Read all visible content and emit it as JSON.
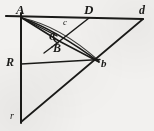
{
  "figure": {
    "type": "geometry-diagram",
    "width": 154,
    "height": 131,
    "background_color": "#f2f1ef",
    "ink_color": "#1a1a18"
  },
  "points": [
    {
      "id": "A",
      "label": "A",
      "x": 21,
      "y": 17,
      "label_x": 16,
      "label_y": 3
    },
    {
      "id": "D",
      "label": "D",
      "x": 89,
      "y": 18,
      "label_x": 84,
      "label_y": 3
    },
    {
      "id": "d",
      "label": "d",
      "x": 143,
      "y": 19,
      "label_x": 139,
      "label_y": 4
    },
    {
      "id": "c",
      "label": "c",
      "x": 67,
      "y": 26,
      "label_x": 63,
      "label_y": 18
    },
    {
      "id": "C",
      "label": "C",
      "x": 56,
      "y": 38,
      "label_x": 49,
      "label_y": 31
    },
    {
      "id": "B",
      "label": "B",
      "x": 59,
      "y": 40,
      "label_x": 53,
      "label_y": 42
    },
    {
      "id": "b",
      "label": "b",
      "x": 99,
      "y": 62,
      "label_x": 101,
      "label_y": 58
    },
    {
      "id": "R",
      "label": "R",
      "x": 21,
      "y": 64,
      "label_x": 6,
      "label_y": 56
    },
    {
      "id": "r",
      "label": "r",
      "x": 21,
      "y": 122,
      "label_x": 10,
      "label_y": 111
    }
  ],
  "segments": [
    {
      "id": "A-d",
      "from": "A",
      "to": "d",
      "note": "top horizontal baseline through D"
    },
    {
      "id": "A-r",
      "from": "A",
      "to": "r",
      "note": "left vertical through R"
    },
    {
      "id": "r-d",
      "from": "r",
      "to": "d",
      "note": "long rising diagonal through b"
    },
    {
      "id": "A-B",
      "from": "A",
      "to": "B",
      "note": "upper chord from apex to B"
    },
    {
      "id": "A-C",
      "from": "A",
      "to": "C",
      "note": "chord from apex to C"
    },
    {
      "id": "D-B",
      "from": "D",
      "to": "B",
      "note": "descending line from D past c to B"
    },
    {
      "id": "R-b",
      "from": "R",
      "to": "b",
      "note": "line from R rising to b"
    },
    {
      "id": "B-b",
      "from": "B",
      "to": "b",
      "note": "short link B to b"
    },
    {
      "id": "C-b",
      "from": "C",
      "to": "b",
      "note": "short link C to b"
    }
  ],
  "arcs": [
    {
      "id": "A-b-arc",
      "from": "A",
      "to": "b",
      "note": "curved arc bowing below the A-b chord"
    },
    {
      "id": "C-arc",
      "from": "C",
      "to": "c",
      "note": "small hook near C"
    }
  ]
}
